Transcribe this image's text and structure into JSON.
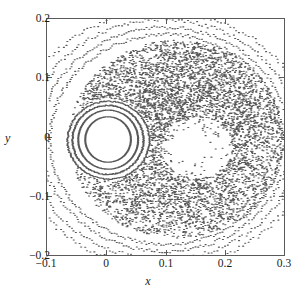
{
  "chart_data": {
    "type": "scatter",
    "title": "",
    "subtitle": "",
    "xlabel": "x",
    "ylabel": "y",
    "xlim": [
      -0.1,
      0.3
    ],
    "ylim": [
      -0.2,
      0.2
    ],
    "grid": false,
    "legend": null,
    "xticks": [
      -0.1,
      0,
      0.1,
      0.2,
      0.3
    ],
    "xticklabels": [
      "−0.1",
      "0",
      "0.1",
      "0.2",
      "0.3"
    ],
    "yticks": [
      -0.2,
      -0.1,
      0,
      0.1,
      0.2
    ],
    "yticklabels": [
      "−0.2",
      "−0.1",
      "0",
      "0.1",
      "0.2"
    ],
    "marker": "dot",
    "marker_size_px": 1.1,
    "point_color": "#3c3c3c",
    "frame_color": "#5a5a5a",
    "background": "#ffffff",
    "series": [
      {
        "name": "inner-island-torus-1",
        "kind": "closed_curve",
        "center": [
          0.0022,
          -0.0042
        ],
        "radius_x": 0.0385,
        "radius_y": 0.0385,
        "n_points": 420,
        "density": "continuous"
      },
      {
        "name": "inner-island-torus-2",
        "kind": "closed_curve",
        "center": [
          0.0024,
          -0.0045
        ],
        "radius_x": 0.0505,
        "radius_y": 0.05,
        "n_points": 430,
        "density": "continuous"
      },
      {
        "name": "inner-island-torus-3",
        "kind": "closed_curve",
        "center": [
          0.002,
          -0.005
        ],
        "radius_x": 0.06,
        "radius_y": 0.0585,
        "n_points": 300,
        "density": "dotted"
      },
      {
        "name": "island-separatrix-halo",
        "kind": "closed_curve",
        "center": [
          0.003,
          -0.0055
        ],
        "radius_x": 0.069,
        "radius_y": 0.066,
        "n_points": 240,
        "density": "dotted"
      },
      {
        "name": "chaotic-sea",
        "kind": "chaotic_region",
        "n_points": 5200,
        "outer_center": [
          0.118,
          -0.004
        ],
        "outer_radius_x": 0.182,
        "outer_radius_y": 0.168,
        "hole_center": [
          0.003,
          -0.005
        ],
        "hole_radius_x": 0.072,
        "hole_radius_y": 0.069,
        "inner_void_center": [
          0.152,
          -0.018
        ],
        "inner_void_radius_x": 0.06,
        "inner_void_radius_y": 0.052,
        "upper_bias": 1.22
      },
      {
        "name": "outer-kam-torus-1",
        "kind": "open_arc",
        "center": [
          0.1,
          -0.004
        ],
        "radius_x": 0.196,
        "radius_y": 0.178,
        "n_points": 300,
        "density": "dotted"
      },
      {
        "name": "outer-kam-torus-2",
        "kind": "open_arc",
        "center": [
          0.098,
          -0.004
        ],
        "radius_x": 0.21,
        "radius_y": 0.19,
        "n_points": 300,
        "density": "dotted"
      },
      {
        "name": "outer-kam-torus-3",
        "kind": "open_arc",
        "center": [
          0.096,
          -0.004
        ],
        "radius_x": 0.228,
        "radius_y": 0.203,
        "n_points": 280,
        "density": "dotted"
      },
      {
        "name": "outer-kam-torus-4",
        "kind": "open_arc",
        "center": [
          0.094,
          -0.004
        ],
        "radius_x": 0.248,
        "radius_y": 0.216,
        "n_points": 260,
        "density": "dotted"
      }
    ]
  }
}
